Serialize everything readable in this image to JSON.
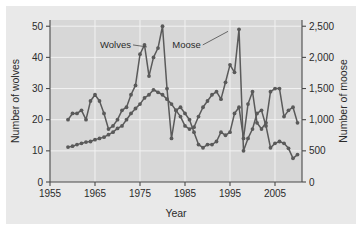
{
  "figure": {
    "background_color": "#ffffff",
    "plot_background_color": "#d7d7d7",
    "panel_color": "#e9e9e9",
    "gridline_color": "#f2f2f2",
    "axis_color": "#4a4a4a",
    "series_color": "#5a5a5a"
  },
  "chart_data": {
    "type": "line",
    "title": "",
    "subtitle": "",
    "xlabel": "Year",
    "ylabel": "Number of wolves",
    "y2label": "Number of moose",
    "xlim": [
      1955,
      2011
    ],
    "ylim": [
      0,
      52
    ],
    "y2lim": [
      0,
      2600
    ],
    "xticks": [
      1955,
      1965,
      1975,
      1985,
      1995,
      2005
    ],
    "xtick_labels": [
      "1955",
      "1965",
      "1975",
      "1985",
      "1995",
      "2005"
    ],
    "yticks": [
      0,
      10,
      20,
      30,
      40,
      50
    ],
    "ytick_labels": [
      "0",
      "10",
      "20",
      "30",
      "40",
      "50"
    ],
    "y2ticks": [
      0,
      500,
      1000,
      1500,
      2000,
      2500
    ],
    "y2tick_labels": [
      "0",
      "500",
      "1,000",
      "1,500",
      "2,000",
      "2,500"
    ],
    "grid": "vertical-and-horizontal-light",
    "legend_position": "inline-annotations",
    "annotations": [
      {
        "text": "Wolves",
        "x": 1973.0,
        "y": 44.0,
        "anchor_x": 1977.0,
        "anchor_y": 44.0
      },
      {
        "text": "Moose",
        "x": 1988.5,
        "y": 44.0,
        "anchor_x": 1995.0,
        "anchor_y": 49.0
      }
    ],
    "series": [
      {
        "name": "Wolves",
        "axis": "left",
        "unit": "count",
        "color": "#5a5a5a",
        "marker": "circle",
        "x": [
          1959,
          1960,
          1961,
          1962,
          1963,
          1964,
          1965,
          1966,
          1967,
          1968,
          1969,
          1970,
          1971,
          1972,
          1973,
          1974,
          1975,
          1976,
          1977,
          1978,
          1979,
          1980,
          1981,
          1982,
          1983,
          1984,
          1985,
          1986,
          1987,
          1988,
          1989,
          1990,
          1991,
          1992,
          1993,
          1994,
          1995,
          1996,
          1997,
          1998,
          1999,
          2000,
          2001,
          2002,
          2003,
          2004,
          2005,
          2006,
          2007,
          2008,
          2009,
          2010
        ],
        "values": [
          20,
          22,
          22,
          23,
          20,
          26,
          28,
          26,
          22,
          17,
          18,
          20,
          23,
          24,
          28,
          31,
          41,
          44,
          34,
          40,
          43,
          50,
          30,
          14,
          23,
          24,
          22,
          20,
          16,
          12,
          11,
          12,
          12,
          13,
          16,
          15,
          16,
          22,
          24,
          14,
          25,
          29,
          19,
          17,
          19,
          29,
          30,
          30,
          21,
          23,
          24,
          19
        ],
        "values_label": "Number of wolves"
      },
      {
        "name": "Moose",
        "axis": "right",
        "unit": "count",
        "color": "#5a5a5a",
        "marker": "circle",
        "x": [
          1959,
          1960,
          1961,
          1962,
          1963,
          1964,
          1965,
          1966,
          1967,
          1968,
          1969,
          1970,
          1971,
          1972,
          1973,
          1974,
          1975,
          1976,
          1977,
          1978,
          1979,
          1980,
          1981,
          1982,
          1983,
          1984,
          1985,
          1986,
          1987,
          1988,
          1989,
          1990,
          1991,
          1992,
          1993,
          1994,
          1995,
          1996,
          1997,
          1998,
          1999,
          2000,
          2001,
          2002,
          2003,
          2004,
          2005,
          2006,
          2007,
          2008,
          2009,
          2010
        ],
        "values": [
          560,
          575,
          600,
          620,
          640,
          650,
          680,
          700,
          720,
          760,
          800,
          860,
          900,
          1000,
          1100,
          1180,
          1250,
          1350,
          1400,
          1480,
          1440,
          1400,
          1330,
          1250,
          1150,
          1050,
          900,
          850,
          880,
          1050,
          1200,
          1300,
          1400,
          1450,
          1330,
          1600,
          1880,
          1760,
          2450,
          500,
          700,
          850,
          1100,
          1150,
          900,
          550,
          620,
          650,
          620,
          540,
          380,
          440
        ],
        "values_label": "Number of moose"
      }
    ]
  }
}
